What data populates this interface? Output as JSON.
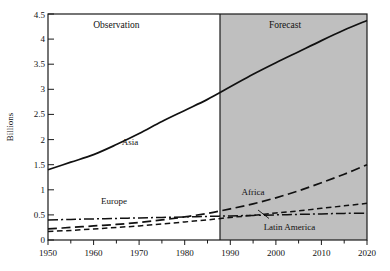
{
  "chart_data": {
    "type": "line",
    "title": "",
    "xlabel": "",
    "ylabel": "Billions",
    "xlim": [
      1950,
      2020
    ],
    "ylim": [
      0,
      4.5
    ],
    "grid": false,
    "legend_position": "inline-labels",
    "x_ticks": [
      "1950",
      "1960",
      "1970",
      "1980",
      "1990",
      "2000",
      "2010",
      "2020"
    ],
    "x_tick_values": [
      1950,
      1960,
      1970,
      1980,
      1990,
      2000,
      2010,
      2020
    ],
    "y_ticks": [
      "0",
      "0.5",
      "1",
      "1.5",
      "2",
      "2.5",
      "3",
      "3.5",
      "4",
      "4.5"
    ],
    "y_tick_values": [
      0,
      0.5,
      1,
      1.5,
      2,
      2.5,
      3,
      3.5,
      4,
      4.5
    ],
    "minor_x_ticks": [
      1955,
      1965,
      1975,
      1985,
      1995,
      2005,
      2015
    ],
    "x": [
      1950,
      1955,
      1960,
      1965,
      1970,
      1975,
      1980,
      1985,
      1990,
      1995,
      2000,
      2005,
      2010,
      2015,
      2020
    ],
    "series": [
      {
        "name": "Asia",
        "style": "solid",
        "color": "#111111",
        "values": [
          1.4,
          1.55,
          1.7,
          1.9,
          2.12,
          2.36,
          2.58,
          2.8,
          3.05,
          3.3,
          3.53,
          3.75,
          3.97,
          4.18,
          4.37
        ]
      },
      {
        "name": "Africa",
        "style": "long-dash",
        "color": "#111111",
        "values": [
          0.22,
          0.25,
          0.28,
          0.31,
          0.35,
          0.4,
          0.46,
          0.53,
          0.62,
          0.72,
          0.84,
          0.98,
          1.14,
          1.31,
          1.5
        ]
      },
      {
        "name": "Latin America",
        "style": "dashed",
        "color": "#111111",
        "values": [
          0.17,
          0.19,
          0.22,
          0.25,
          0.28,
          0.32,
          0.36,
          0.4,
          0.45,
          0.49,
          0.54,
          0.58,
          0.63,
          0.68,
          0.73
        ]
      },
      {
        "name": "Europe",
        "style": "dash-dot",
        "color": "#111111",
        "values": [
          0.4,
          0.41,
          0.42,
          0.43,
          0.44,
          0.45,
          0.46,
          0.47,
          0.48,
          0.49,
          0.5,
          0.51,
          0.52,
          0.53,
          0.53
        ]
      }
    ],
    "annotations": [
      {
        "text": "Observation",
        "x": 1965,
        "y": 4.22
      },
      {
        "text": "Forecast",
        "x": 2002,
        "y": 4.22
      }
    ],
    "series_labels": [
      {
        "text": "Asia",
        "x": 1968,
        "y": 1.9
      },
      {
        "text": "Europe",
        "x": 1964.5,
        "y": 0.72
      },
      {
        "text": "Africa",
        "x": 1995,
        "y": 0.9
      },
      {
        "text": "Latin America",
        "x": 2003,
        "y": 0.2
      }
    ],
    "regions": [
      {
        "name": "observation",
        "from": 1950,
        "to": 1985,
        "fill": "#ffffff"
      },
      {
        "name": "forecast",
        "from": 1985,
        "to": 2020,
        "fill": "#bfbfbf"
      }
    ],
    "divider_x": 1985
  }
}
